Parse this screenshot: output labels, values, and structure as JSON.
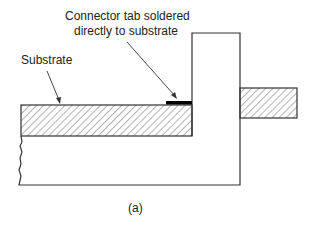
{
  "diagram": {
    "labels": {
      "connector_line1": "Connector tab soldered",
      "connector_line2": "directly to substrate",
      "substrate": "Substrate",
      "caption": "(a)"
    },
    "parts": [
      {
        "name": "substrate",
        "style": "hatched"
      },
      {
        "name": "connector-tab-solder",
        "style": "solid-black"
      },
      {
        "name": "connector-body",
        "style": "outline"
      },
      {
        "name": "external-tab",
        "style": "hatched"
      },
      {
        "name": "housing",
        "style": "outline"
      }
    ],
    "colors": {
      "line": "#333333",
      "hatch": "#555555",
      "solder": "#000000",
      "background": "#ffffff"
    }
  }
}
